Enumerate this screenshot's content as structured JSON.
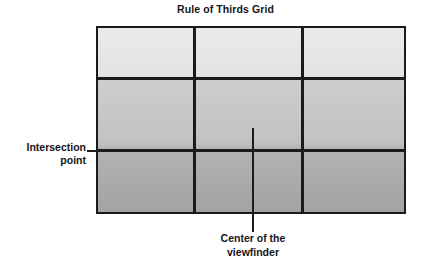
{
  "diagram": {
    "title": "Rule of Thirds Grid",
    "type": "rule-of-thirds-viewfinder-grid",
    "frame": {
      "rows": 3,
      "columns": 3,
      "cells": 9,
      "border_color": "#1b1b1b",
      "gridline_color": "#1b1b1b",
      "fill_top_color": "#ededed",
      "fill_middle_color": "#c3c3c3",
      "fill_bottom_color": "#a4a4a4"
    },
    "callouts": [
      {
        "id": "intersection-point",
        "line1": "Intersection",
        "line2": "point",
        "text": "Intersection point",
        "position": "left",
        "points_to": "left-lower grid line intersection"
      },
      {
        "id": "center-of-viewfinder",
        "line1": "Center of the",
        "line2": "viewfinder",
        "text": "Center of the viewfinder",
        "position": "bottom",
        "points_to": "center of the grid frame"
      }
    ]
  }
}
